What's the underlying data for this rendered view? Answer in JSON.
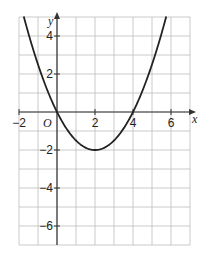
{
  "chart_data": {
    "type": "line",
    "title": "",
    "xlabel": "x",
    "ylabel": "y",
    "origin_label": "O",
    "xlim": [
      -2,
      7
    ],
    "ylim": [
      -7,
      5
    ],
    "grid": true,
    "grid_step": 1,
    "x_ticks": [
      {
        "value": -2,
        "label": "−2"
      },
      {
        "value": 2,
        "label": "2"
      },
      {
        "value": 4,
        "label": "4"
      },
      {
        "value": 6,
        "label": "6"
      }
    ],
    "y_ticks": [
      {
        "value": 4,
        "label": "4"
      },
      {
        "value": 2,
        "label": "2"
      },
      {
        "value": -2,
        "label": "−2"
      },
      {
        "value": -4,
        "label": "−4"
      },
      {
        "value": -6,
        "label": "−6"
      }
    ],
    "series": [
      {
        "name": "y = 0.5x² − 2x",
        "equation": "y = 0.5x^2 - 2x",
        "x": [
          -1.7,
          -1,
          0,
          1,
          2,
          3,
          4,
          5,
          5.7
        ],
        "y": [
          4.85,
          2.5,
          0,
          -1.5,
          -2,
          -1.5,
          0,
          2.5,
          4.85
        ],
        "color": "#222222"
      }
    ],
    "key_points": {
      "roots": [
        [
          0,
          0
        ],
        [
          4,
          0
        ]
      ],
      "vertex": [
        2,
        -2
      ]
    }
  }
}
